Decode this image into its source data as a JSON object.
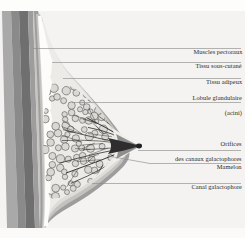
{
  "figure": {
    "kind": "anatomical-diagram",
    "language": "fr",
    "background_color": "#f4f3f1",
    "text_color": "#2b2b2b",
    "leader_line_color": "#8d8d8d"
  },
  "labels": [
    {
      "id": "muscles-pectoraux",
      "text": "Muscles pectoraux",
      "lines": [
        "Muscles pectoraux"
      ]
    },
    {
      "id": "tissu-sous-cutane",
      "text": "Tissu sous-cutané",
      "lines": [
        "Tissu sous-cutané"
      ]
    },
    {
      "id": "tissu-adipeux",
      "text": "Tissu adipeux",
      "lines": [
        "Tissu adipeux"
      ]
    },
    {
      "id": "lobule-glandulaire",
      "text": "Lobule glandulaire (acini)",
      "lines": [
        "Lobule glandulaire",
        "(acini)"
      ]
    },
    {
      "id": "orifices-canaux",
      "text": "Orifices des canaux galactophores",
      "lines": [
        "Orifices",
        "des canaux galactophores"
      ]
    },
    {
      "id": "mamelon",
      "text": "Mamelon",
      "lines": [
        "Mamelon"
      ]
    },
    {
      "id": "canal-galactophore",
      "text": "Canal galactophore",
      "lines": [
        "Canal galactophore"
      ]
    }
  ],
  "label_lines": {
    "muscles_pectoraux_1": "Muscles pectoraux",
    "tissu_sous_cutane_1": "Tissu sous-cutané",
    "tissu_adipeux_1": "Tissu adipeux",
    "lobule_glandulaire_1": "Lobule glandulaire",
    "lobule_glandulaire_2": "(acini)",
    "orifices_1": "Orifices",
    "orifices_2": "des canaux galactophores",
    "mamelon_1": "Mamelon",
    "canal_galactophore_1": "Canal galactophore"
  },
  "anatomy": {
    "structures": [
      {
        "id": "rib-cage-band",
        "name": "Paroi thoracique",
        "color": "#8e8e8e"
      },
      {
        "id": "pectoral-muscle",
        "name": "Muscles pectoraux",
        "color": "#7c7c7c"
      },
      {
        "id": "fascia-band",
        "name": "Fascia",
        "color": "#b9b9b9"
      },
      {
        "id": "subcutaneous-tissue",
        "name": "Tissu sous-cutané",
        "color": "#fbfbfa"
      },
      {
        "id": "adipose-tissue",
        "name": "Tissu adipeux",
        "color": "#dcdbd7"
      },
      {
        "id": "skin-band",
        "name": "Peau",
        "color": "#9a9a9a"
      },
      {
        "id": "glandular-lobules",
        "name": "Lobules glandulaires",
        "color": "#d8d7d2"
      },
      {
        "id": "lactiferous-ducts",
        "name": "Canaux galactophores",
        "color": "#3a3a3a"
      },
      {
        "id": "nipple",
        "name": "Mamelon",
        "color": "#2e2e2e"
      }
    ],
    "lobule_count": 118,
    "duct_count": 16
  }
}
